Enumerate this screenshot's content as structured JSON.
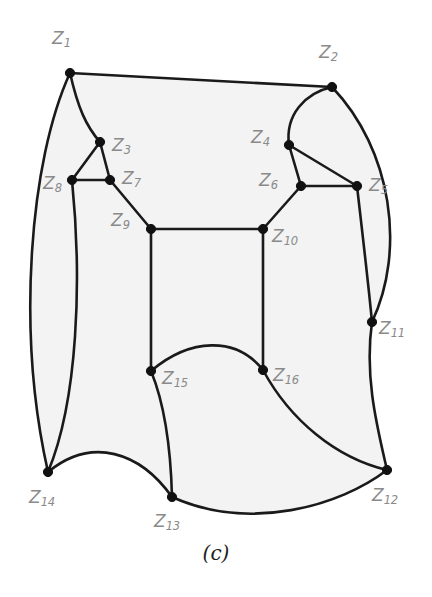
{
  "figure": {
    "caption": "(c)",
    "background_color": "#ffffff",
    "region_fill_color": "#f3f3f3",
    "edge_color": "#1a1a1a",
    "node_color": "#111111",
    "label_color": "#8a8a8a"
  },
  "chart_data": {
    "type": "diagram",
    "title": "(c)",
    "nodes": [
      {
        "id": "Z1",
        "label_main": "Z",
        "label_sub": "1",
        "x": 70,
        "y": 73,
        "label_x": 52,
        "label_y": 30
      },
      {
        "id": "Z2",
        "label_main": "Z",
        "label_sub": "2",
        "x": 332,
        "y": 87,
        "label_x": 319,
        "label_y": 44
      },
      {
        "id": "Z3",
        "label_main": "Z",
        "label_sub": "3",
        "x": 100,
        "y": 142,
        "label_x": 112,
        "label_y": 137
      },
      {
        "id": "Z4",
        "label_main": "Z",
        "label_sub": "4",
        "x": 289,
        "y": 145,
        "label_x": 251,
        "label_y": 129
      },
      {
        "id": "Z5",
        "label_main": "Z",
        "label_sub": "5",
        "x": 357,
        "y": 186,
        "label_x": 369,
        "label_y": 177
      },
      {
        "id": "Z6",
        "label_main": "Z",
        "label_sub": "6",
        "x": 301,
        "y": 186,
        "label_x": 259,
        "label_y": 172
      },
      {
        "id": "Z7",
        "label_main": "Z",
        "label_sub": "7",
        "x": 110,
        "y": 180,
        "label_x": 122,
        "label_y": 170
      },
      {
        "id": "Z8",
        "label_main": "Z",
        "label_sub": "8",
        "x": 72,
        "y": 180,
        "label_x": 43,
        "label_y": 175
      },
      {
        "id": "Z9",
        "label_main": "Z",
        "label_sub": "9",
        "x": 151,
        "y": 229,
        "label_x": 111,
        "label_y": 212
      },
      {
        "id": "Z10",
        "label_main": "Z",
        "label_sub": "10",
        "x": 263,
        "y": 229,
        "label_x": 272,
        "label_y": 228
      },
      {
        "id": "Z11",
        "label_main": "Z",
        "label_sub": "11",
        "x": 372,
        "y": 322,
        "label_x": 379,
        "label_y": 320
      },
      {
        "id": "Z12",
        "label_main": "Z",
        "label_sub": "12",
        "x": 387,
        "y": 470,
        "label_x": 372,
        "label_y": 487
      },
      {
        "id": "Z13",
        "label_main": "Z",
        "label_sub": "13",
        "x": 172,
        "y": 497,
        "label_x": 154,
        "label_y": 513
      },
      {
        "id": "Z14",
        "label_main": "Z",
        "label_sub": "14",
        "x": 48,
        "y": 472,
        "label_x": 29,
        "label_y": 489
      },
      {
        "id": "Z15",
        "label_main": "Z",
        "label_sub": "15",
        "x": 151,
        "y": 371,
        "label_x": 162,
        "label_y": 370
      },
      {
        "id": "Z16",
        "label_main": "Z",
        "label_sub": "16",
        "x": 263,
        "y": 370,
        "label_x": 273,
        "label_y": 367
      }
    ],
    "edges": [
      {
        "from": "Z1",
        "to": "Z2",
        "shape": "line",
        "path": "M 70 73 L 332 87"
      },
      {
        "from": "Z1",
        "to": "Z3",
        "shape": "curve",
        "path": "M 70 73 C 78 108 86 126 100 142"
      },
      {
        "from": "Z1",
        "to": "Z14",
        "shape": "curve",
        "path": "M 70 73 C 30 160 16 330 48 472"
      },
      {
        "from": "Z3",
        "to": "Z8",
        "shape": "line",
        "path": "M 100 142 L 72 180"
      },
      {
        "from": "Z3",
        "to": "Z7",
        "shape": "line",
        "path": "M 100 142 L 110 180"
      },
      {
        "from": "Z8",
        "to": "Z7",
        "shape": "line",
        "path": "M 72 180 L 110 180"
      },
      {
        "from": "Z7",
        "to": "Z9",
        "shape": "line",
        "path": "M 110 180 L 151 229"
      },
      {
        "from": "Z8",
        "to": "Z14",
        "shape": "curve",
        "path": "M 72 180 C 82 280 78 400 48 472"
      },
      {
        "from": "Z9",
        "to": "Z10",
        "shape": "line",
        "path": "M 151 229 L 263 229"
      },
      {
        "from": "Z9",
        "to": "Z15",
        "shape": "line",
        "path": "M 151 229 L 151 371"
      },
      {
        "from": "Z10",
        "to": "Z16",
        "shape": "line",
        "path": "M 263 229 L 263 370"
      },
      {
        "from": "Z10",
        "to": "Z6",
        "shape": "line",
        "path": "M 263 229 L 301 186"
      },
      {
        "from": "Z6",
        "to": "Z4",
        "shape": "line",
        "path": "M 301 186 L 289 145"
      },
      {
        "from": "Z6",
        "to": "Z5",
        "shape": "line",
        "path": "M 301 186 L 357 186"
      },
      {
        "from": "Z4",
        "to": "Z5",
        "shape": "line",
        "path": "M 289 145 L 357 186"
      },
      {
        "from": "Z4",
        "to": "Z2",
        "shape": "curve",
        "path": "M 289 145 C 285 115 305 93 332 87"
      },
      {
        "from": "Z2",
        "to": "Z11",
        "shape": "curve",
        "path": "M 332 87 C 392 150 406 250 372 322"
      },
      {
        "from": "Z5",
        "to": "Z11",
        "shape": "curve",
        "path": "M 357 186 C 362 230 368 280 372 322"
      },
      {
        "from": "Z11",
        "to": "Z12",
        "shape": "curve",
        "path": "M 372 322 C 364 378 378 430 387 470"
      },
      {
        "from": "Z15",
        "to": "Z16",
        "shape": "curve",
        "path": "M 151 371 C 190 338 236 336 263 370"
      },
      {
        "from": "Z15",
        "to": "Z13",
        "shape": "curve",
        "path": "M 151 371 C 167 410 171 458 172 497"
      },
      {
        "from": "Z16",
        "to": "Z12",
        "shape": "curve",
        "path": "M 263 370 C 290 420 336 458 387 470"
      },
      {
        "from": "Z14",
        "to": "Z13",
        "shape": "curve",
        "path": "M 48 472 C 92 436 140 452 172 497"
      },
      {
        "from": "Z13",
        "to": "Z12",
        "shape": "curve",
        "path": "M 172 497 C 250 532 340 506 387 470"
      }
    ],
    "region_path": "M 70 73 C 30 160 16 330 48 472 C 92 436 140 452 172 497 C 250 532 340 506 387 470 C 378 430 364 378 372 322 C 406 250 392 150 332 87 L 70 73 Z"
  }
}
